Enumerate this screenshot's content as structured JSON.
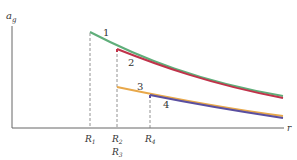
{
  "axes": {
    "y_label": "a",
    "y_label_sub": "g",
    "x_label": "r"
  },
  "curves": [
    {
      "id": "1",
      "label": "1",
      "color": "#5fae7a",
      "start_tick": "R1"
    },
    {
      "id": "2",
      "label": "2",
      "color": "#c0334a",
      "start_tick": "R2"
    },
    {
      "id": "3",
      "label": "3",
      "color": "#e8a84a",
      "start_tick": "R3"
    },
    {
      "id": "4",
      "label": "4",
      "color": "#5a4fa0",
      "start_tick": "R4"
    }
  ],
  "ticks": [
    {
      "name": "R",
      "sub": "1"
    },
    {
      "name": "R",
      "sub": "2"
    },
    {
      "name": "R",
      "sub": "3"
    },
    {
      "name": "R",
      "sub": "4"
    }
  ]
}
